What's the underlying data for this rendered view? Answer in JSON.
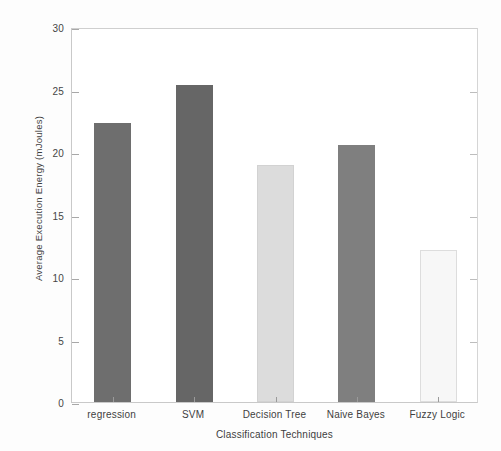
{
  "chart_data": {
    "type": "bar",
    "title": "",
    "xlabel": "Classification Techniques",
    "ylabel": "Average Execution Energy (mJoules)",
    "categories": [
      "regression",
      "SVM",
      "Decision Tree",
      "Naive Bayes",
      "Fuzzy Logic"
    ],
    "values": [
      22.3,
      25.4,
      19.0,
      20.6,
      12.2
    ],
    "bar_colors": [
      "#6e6e6e",
      "#666666",
      "#dcdcdc",
      "#7f7f7f",
      "#f7f7f7"
    ],
    "bar_edge_colors": [
      "#6e6e6e",
      "#666666",
      "#d2d2d2",
      "#7f7f7f",
      "#dddddd"
    ],
    "ylim": [
      0,
      30
    ],
    "yticks": [
      0,
      5,
      10,
      15,
      20,
      25,
      30
    ],
    "ytick_labels": [
      "0",
      "5",
      "10",
      "15",
      "20",
      "25",
      "30"
    ],
    "grid": false,
    "legend": null,
    "axis_color": "#c9c9c9",
    "background": "#ffffff"
  },
  "figure": {
    "page_background": "#fdfdfd"
  }
}
